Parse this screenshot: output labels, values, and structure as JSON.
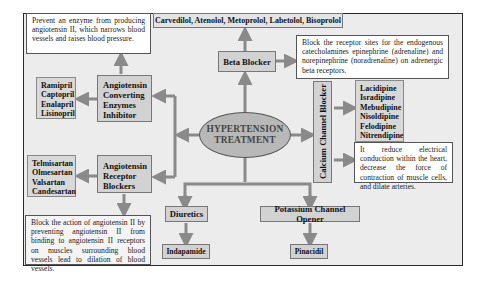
{
  "center": {
    "line1": "HYPERTENSION",
    "line2": "TREATMENT"
  },
  "beta_blocker": {
    "label": "Beta Blocker",
    "drugs": "Carvedilol,  Atenolol,  Metoprolol,  Labetolol,  Bisoprolol",
    "description": "Block the receptor sites for the endogenous catecholamines epinephrine (adrenaline) and norepinephrine (noradrenaline) on adrenergic beta receptors."
  },
  "ace_inhibitor": {
    "label_lines": [
      "Angiotensin",
      "Converting",
      "Enzymes",
      "Inhibitor"
    ],
    "drugs": [
      "Ramipril",
      "Captopril",
      "Enalapril",
      "Lisinopril"
    ],
    "description": "Prevent an enzyme from producing angiotensin II, which narrows blood vessels and raises blood pressure."
  },
  "arb": {
    "label_lines": [
      "Angiotensin",
      "Receptor",
      "Blockers"
    ],
    "drugs": [
      "Telmisartan",
      "Olmesartan",
      "Valsartan",
      "Candesartan"
    ],
    "description": "Block the action of angiotensin II by preventing angiotensin II from binding to angiotensin II receptors on muscles surrounding blood vessels lead to dilation of blood vessels."
  },
  "calcium_channel_blocker": {
    "label": "Calcium Channel Blocker",
    "drugs": [
      "Lacidipine",
      "Isradipine",
      "Mebudipine",
      "Nisoldipine",
      "Felodipine",
      "Nitrendipine"
    ],
    "description": "It reduce electrical conduction within the heart, decrease the force of contraction of muscle cells, and dilate arteries."
  },
  "diuretics": {
    "label": "Diuretics",
    "drugs": "Indapamide"
  },
  "potassium_channel_opener": {
    "label": "Potassium Channel Opener",
    "drugs": "Pinacidil"
  },
  "colors": {
    "frame_bg": "#ececec",
    "box_bg": "#d2d2d2",
    "ellipse_bg": "#b8b8b8",
    "arrow": "#8a8a8a"
  }
}
